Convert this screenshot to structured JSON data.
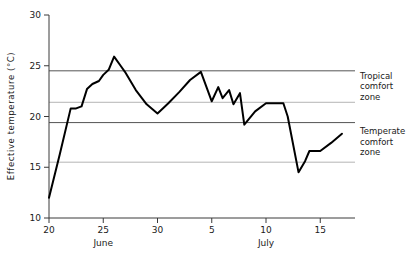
{
  "chart_data": {
    "type": "line",
    "title": "",
    "subtitle": "",
    "xlabel": "",
    "ylabel": "Effective temperature (°C)",
    "ylim": [
      10,
      30
    ],
    "xlim": [
      "June 20",
      "July 17"
    ],
    "grid": false,
    "legend_position": "right-inline",
    "y_ticks": [
      {
        "value": 30,
        "label": "30"
      },
      {
        "value": 25,
        "label": "25"
      },
      {
        "value": 20,
        "label": "20"
      },
      {
        "value": 15,
        "label": "15"
      },
      {
        "value": 10,
        "label": "10"
      }
    ],
    "x_ticks": [
      {
        "day_index": 0,
        "label": "20"
      },
      {
        "day_index": 5,
        "label": "25"
      },
      {
        "day_index": 10,
        "label": "30"
      },
      {
        "day_index": 15,
        "label": "5"
      },
      {
        "day_index": 20,
        "label": "10"
      },
      {
        "day_index": 25,
        "label": "15"
      }
    ],
    "month_labels": [
      {
        "day_index": 5,
        "label": "June"
      },
      {
        "day_index": 20,
        "label": "July"
      }
    ],
    "bands": [
      {
        "name": "Tropical comfort zone",
        "annotation_lines": [
          "Tropical",
          "comfort",
          "zone"
        ],
        "lower": 21.4,
        "upper": 24.5,
        "upper_line_style": "dark",
        "lower_line_style": "light"
      },
      {
        "name": "Temperate comfort zone",
        "annotation_lines": [
          "Temperate",
          "comfort",
          "zone"
        ],
        "lower": 15.5,
        "upper": 19.4,
        "upper_line_style": "dark",
        "lower_line_style": "light"
      }
    ],
    "series": [
      {
        "name": "Effective temperature",
        "color": "#000000",
        "x": [
          "June 20",
          "June 21",
          "June 22",
          "June 22.5",
          "June 23",
          "June 23.5",
          "June 24",
          "June 24.6",
          "June 25",
          "June 25.5",
          "June 26",
          "June 26.6",
          "June 27",
          "June 28",
          "June 29",
          "June 30",
          "July 1",
          "July 2",
          "July 3",
          "July 4",
          "July 5",
          "July 5.6",
          "July 6",
          "July 6.6",
          "July 7",
          "July 7.6",
          "July 8",
          "July 9",
          "July 10",
          "July 11",
          "July 11.6",
          "July 12",
          "July 13",
          "July 13.6",
          "July 14",
          "July 15",
          "July 16",
          "July 17"
        ],
        "values": [
          12.0,
          16.3,
          20.8,
          20.8,
          21.0,
          22.7,
          23.2,
          23.5,
          24.1,
          24.6,
          25.9,
          25.0,
          24.4,
          22.6,
          21.2,
          20.3,
          21.3,
          22.4,
          23.6,
          24.4,
          21.5,
          22.9,
          21.8,
          22.6,
          21.2,
          22.3,
          19.2,
          20.5,
          21.3,
          21.3,
          21.3,
          20.0,
          14.5,
          15.6,
          16.6,
          16.6,
          17.4,
          18.3
        ]
      }
    ]
  },
  "axis": {
    "y_title": "Effective temperature (°C)"
  }
}
